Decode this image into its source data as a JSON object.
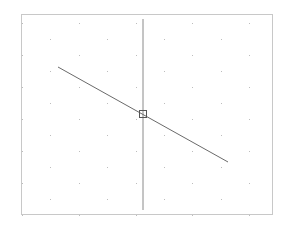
{
  "canvas": {
    "background_color": "#ffffff",
    "frame_color": "#c8c8c8",
    "grid": {
      "style": "staggered-dots",
      "dot_color": "#bdbdbd"
    },
    "elements": [
      {
        "name": "vertical-line",
        "type": "line",
        "color": "#8a8a8a"
      },
      {
        "name": "diagonal-line",
        "type": "line",
        "color": "#6a6a6a"
      },
      {
        "name": "intersection-marker",
        "type": "square-marker",
        "color": "#555555"
      }
    ]
  }
}
